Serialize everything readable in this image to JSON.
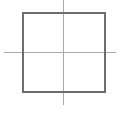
{
  "canvas": {
    "width": 120,
    "height": 113,
    "background_color": "#ffffff"
  },
  "figure": {
    "shapes": [
      {
        "id": "square-outline",
        "name": "square",
        "kind": "rect",
        "x": 23,
        "y": 13,
        "width": 82,
        "height": 79,
        "stroke_color": "#6e6e6e",
        "stroke_width": 1.6,
        "fill": "none"
      },
      {
        "id": "vertical-axis-line",
        "name": "vertical-line",
        "kind": "line",
        "x1": 63.5,
        "y1": 0,
        "x2": 63.5,
        "y2": 105,
        "stroke_color": "#a9a9a9",
        "stroke_width": 1.6
      },
      {
        "id": "horizontal-axis-line",
        "name": "horizontal-line",
        "kind": "line",
        "x1": 4,
        "y1": 52.5,
        "x2": 116,
        "y2": 52.5,
        "stroke_color": "#a9a9a9",
        "stroke_width": 1.6
      }
    ],
    "intersection_point": {
      "x": 63.5,
      "y": 52.5
    }
  }
}
